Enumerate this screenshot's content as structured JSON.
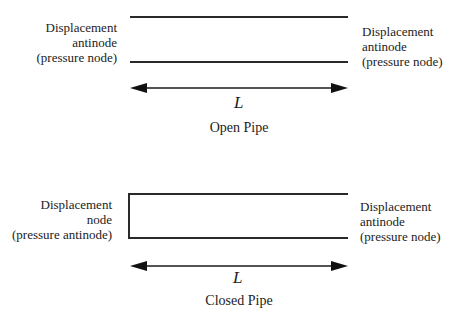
{
  "open_pipe": {
    "left_label": [
      "Displacement",
      "antinode",
      "(pressure node)"
    ],
    "right_label": [
      "Displacement",
      "antinode",
      "(pressure node)"
    ],
    "length_label": "L",
    "caption": "Open Pipe"
  },
  "closed_pipe": {
    "left_label": [
      "Displacement",
      "node",
      "(pressure antinode)"
    ],
    "right_label": [
      "Displacement",
      "antinode",
      "(pressure node)"
    ],
    "length_label": "L",
    "caption": "Closed Pipe"
  }
}
